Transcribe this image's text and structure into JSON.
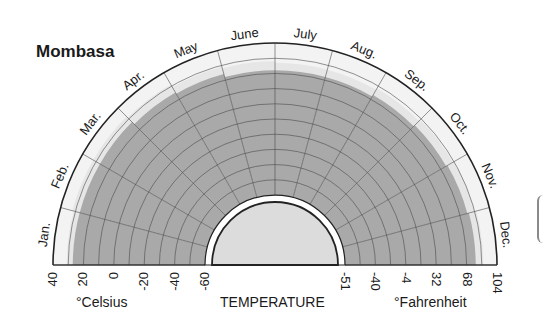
{
  "chart_data": {
    "type": "radial-temperature",
    "title": "Mombasa",
    "center_label": "TEMPERATURE",
    "months": [
      "Jan.",
      "Feb.",
      "Mar.",
      "Apr.",
      "May",
      "June",
      "July",
      "Aug.",
      "Sep.",
      "Oct.",
      "Nov.",
      "Dec."
    ],
    "celsius_axis": {
      "label": "°Celsius",
      "ticks": [
        "40",
        "20",
        "0",
        "-20",
        "-40",
        "-60"
      ],
      "range": [
        -60,
        40
      ]
    },
    "fahrenheit_axis": {
      "label": "°Fahrenheit",
      "ticks": [
        "-51",
        "-40",
        "-4",
        "32",
        "68",
        "104"
      ]
    },
    "series": [
      {
        "name": "Mean minimum (dark band)",
        "unit": "°C",
        "values": [
          27,
          27,
          27,
          25,
          24,
          22,
          22,
          22,
          23,
          24,
          25,
          26
        ]
      },
      {
        "name": "Mean maximum (light band)",
        "unit": "°C",
        "values": [
          31,
          32,
          32,
          31,
          29,
          28,
          27,
          27,
          28,
          29,
          30,
          31
        ]
      }
    ],
    "gridlines_celsius_step": 10,
    "legend_position": "none"
  },
  "colors": {
    "dark_band": "#a9a9a9",
    "light_band": "#e6e6e6",
    "outer_ring": "#f3f3f3",
    "inner_disc": "#dcdcdc",
    "grid": "#4a4a4a",
    "text": "#1a1a1a"
  }
}
